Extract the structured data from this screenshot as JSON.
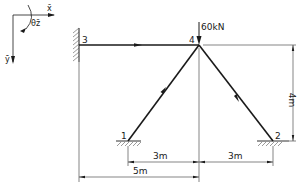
{
  "diagram": {
    "type": "plane frame / truss structure",
    "coordinate_system": {
      "x_label": "x̄",
      "y_label": "ȳ",
      "rotation_label": "θz̄"
    },
    "nodes": [
      {
        "id": "1",
        "label": "1",
        "support": "pinned-ground"
      },
      {
        "id": "2",
        "label": "2",
        "support": "pinned-ground"
      },
      {
        "id": "3",
        "label": "3",
        "support": "fixed-wall"
      },
      {
        "id": "4",
        "label": "4",
        "support": "free"
      }
    ],
    "members": [
      {
        "from": "3",
        "to": "4"
      },
      {
        "from": "1",
        "to": "4"
      },
      {
        "from": "2",
        "to": "4"
      }
    ],
    "load": {
      "node": "4",
      "direction": "down",
      "label": "60kN"
    },
    "dimensions": {
      "left_span": "3m",
      "right_span": "3m",
      "overall_horizontal": "5m",
      "height": "4m"
    }
  }
}
